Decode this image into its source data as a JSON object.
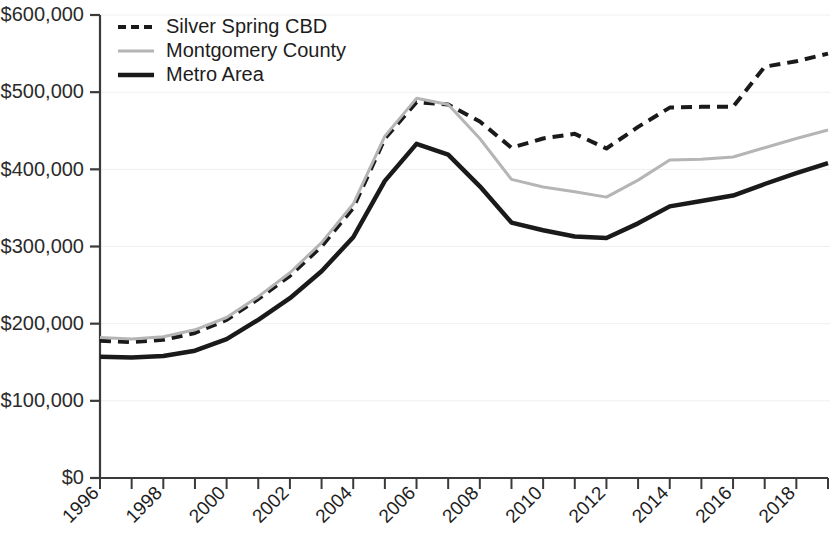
{
  "chart_data": {
    "type": "line",
    "title": "",
    "subtitle": "",
    "xlabel": "",
    "ylabel": "",
    "xlim": [
      1996,
      2019
    ],
    "ylim": [
      0,
      600000
    ],
    "grid": false,
    "legend_position": "top-left",
    "y_tick_labels": [
      "$600,000",
      "$500,000",
      "$400,000",
      "$300,000",
      "$200,000",
      "$100,000",
      "$0"
    ],
    "y_tick_values": [
      600000,
      500000,
      400000,
      300000,
      200000,
      100000,
      0
    ],
    "x": [
      1996,
      1997,
      1998,
      1999,
      2000,
      2001,
      2002,
      2003,
      2004,
      2005,
      2006,
      2007,
      2008,
      2009,
      2010,
      2011,
      2012,
      2013,
      2014,
      2015,
      2016,
      2017,
      2018,
      2019
    ],
    "x_tick_labels": [
      "1996",
      "1998",
      "2000",
      "2002",
      "2004",
      "2006",
      "2008",
      "2010",
      "2012",
      "2014",
      "2016",
      "2018"
    ],
    "x_tick_values": [
      1996,
      1998,
      2000,
      2002,
      2004,
      2006,
      2008,
      2010,
      2012,
      2014,
      2016,
      2018
    ],
    "series": [
      {
        "name": "Silver Spring CBD",
        "style": "dashed",
        "color": "#1a1a1a",
        "width": 4,
        "values": [
          178000,
          176000,
          179000,
          188000,
          205000,
          232000,
          262000,
          300000,
          350000,
          440000,
          487000,
          484000,
          462000,
          428000,
          440000,
          446000,
          427000,
          455000,
          480000,
          481000,
          481000,
          533000,
          540000,
          550000
        ]
      },
      {
        "name": "Montgomery County",
        "style": "solid",
        "color": "#b5b5b5",
        "width": 3,
        "values": [
          182000,
          180000,
          183000,
          192000,
          208000,
          235000,
          266000,
          305000,
          355000,
          443000,
          492000,
          484000,
          440000,
          387000,
          377000,
          371000,
          364000,
          386000,
          412000,
          413000,
          416000,
          428000,
          440000,
          451000
        ]
      },
      {
        "name": "Metro Area",
        "style": "solid",
        "color": "#1a1a1a",
        "width": 4.5,
        "values": [
          157000,
          156000,
          158000,
          165000,
          180000,
          205000,
          233000,
          268000,
          312000,
          385000,
          433000,
          419000,
          378000,
          331000,
          321000,
          313000,
          311000,
          330000,
          352000,
          359000,
          366000,
          381000,
          395000,
          408000
        ]
      }
    ]
  },
  "legend": {
    "items": [
      {
        "label": "Silver Spring CBD"
      },
      {
        "label": "Montgomery County"
      },
      {
        "label": "Metro Area"
      }
    ]
  }
}
